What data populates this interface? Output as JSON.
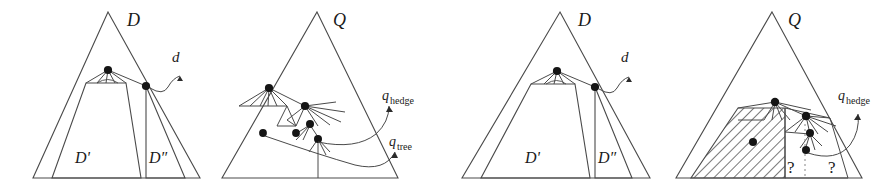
{
  "figure": {
    "kind": "four-panel-tree-diagram",
    "width": 891,
    "height": 194,
    "ink_color": "#4a4a4a",
    "node_color": "#151515",
    "hatch_color": "#555555",
    "dotted_color": "#9a9a9a"
  },
  "panels": [
    {
      "id": "panel-1",
      "title": "D",
      "title_label": "D",
      "region_labels": [
        "D'",
        "D″"
      ],
      "annotation_labels": [
        "d"
      ],
      "node_count": 2,
      "hatched": false,
      "question_marks": []
    },
    {
      "id": "panel-2",
      "title": "Q",
      "title_label": "Q",
      "region_labels": [],
      "annotation_labels": [
        "q",
        "hedge",
        "q",
        "tree"
      ],
      "node_count": 5,
      "hatched": false,
      "question_marks": []
    },
    {
      "id": "panel-3",
      "title": "D",
      "title_label": "D",
      "region_labels": [
        "D'",
        "D″"
      ],
      "annotation_labels": [
        "d"
      ],
      "node_count": 2,
      "hatched": false,
      "question_marks": []
    },
    {
      "id": "panel-4",
      "title": "Q",
      "title_label": "Q",
      "region_labels": [],
      "annotation_labels": [
        "q",
        "hedge"
      ],
      "node_count": 4,
      "hatched": true,
      "question_marks": [
        "?",
        "?"
      ]
    }
  ],
  "labels": {
    "D": "D",
    "Q": "Q",
    "D_prime": "D'",
    "D_double_prime": "D″",
    "d": "d",
    "q": "q",
    "hedge": "hedge",
    "tree": "tree",
    "question": "?"
  }
}
